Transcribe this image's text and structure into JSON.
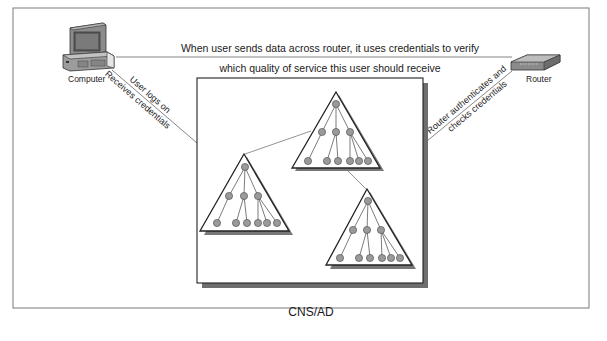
{
  "diagram": {
    "top_caption_line1": "When user sends data across router, it uses credentials to verify",
    "top_caption_line2": "which quality of service this user should receive",
    "computer_label": "Computer",
    "router_label": "Router",
    "left_link_line1": "User logs on",
    "left_link_line2": "Receives credentials",
    "right_link_line1": "Router authenticates and",
    "right_link_line2": "checks credentials",
    "container_label": "CNS/AD",
    "trees": [
      {
        "name": "top-tree",
        "nodes": 10
      },
      {
        "name": "left-tree",
        "nodes": 10
      },
      {
        "name": "right-tree",
        "nodes": 10
      }
    ],
    "colors": {
      "line": "#555555",
      "node_fill": "#9a9a9a",
      "shadow": "#6e6e6e",
      "frame": "#7a7a7a"
    }
  }
}
